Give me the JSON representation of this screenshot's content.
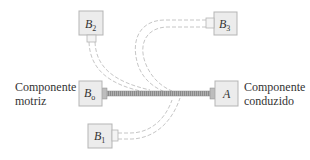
{
  "diagram": {
    "title": "",
    "components": {
      "driver_label_line1": "Componente",
      "driver_label_line2": "motriz",
      "driven_label_line1": "Componente",
      "driven_label_line2": "conduzido"
    },
    "boxes": [
      {
        "id": "B0",
        "letter": "B",
        "subscript": "o",
        "role": "driver"
      },
      {
        "id": "A",
        "letter": "A",
        "subscript": "",
        "role": "driven"
      },
      {
        "id": "B1",
        "letter": "B",
        "subscript": "1",
        "role": "alternate-position"
      },
      {
        "id": "B2",
        "letter": "B",
        "subscript": "2",
        "role": "alternate-position"
      },
      {
        "id": "B3",
        "letter": "B",
        "subscript": "3",
        "role": "alternate-position"
      }
    ],
    "colors": {
      "box_fill": "#ececec",
      "box_stroke": "#b5b5b5",
      "shaft": "#9a9a9a",
      "dashed_path": "#c8c8c8",
      "text": "#333333"
    }
  }
}
